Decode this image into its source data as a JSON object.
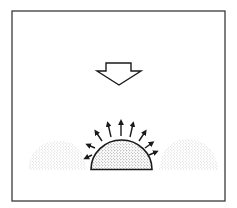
{
  "diagram": {
    "colors": {
      "background": "#ffffff",
      "stroke": "#1a1a1a",
      "stipple": "#8a8a8a",
      "frame": "#3a3a3a"
    },
    "elements": {
      "frame": "rectangular border",
      "down_arrow": "hollow block arrow pointing down",
      "central_dome": "stippled half-disc with bold outline",
      "rays": "9 outward radial arrows from dome",
      "left_mound": "faint stippled mound",
      "right_mound": "faint stippled mound"
    }
  }
}
